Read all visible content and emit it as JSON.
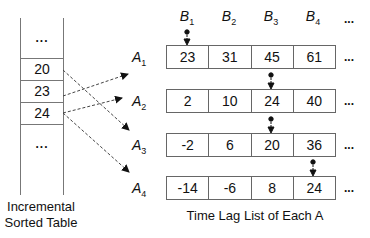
{
  "sorted_table": {
    "caption_line1": "Incremental",
    "caption_line2": "Sorted Table",
    "top_ellipsis": "...",
    "values": [
      "20",
      "23",
      "24"
    ],
    "bottom_ellipsis": "..."
  },
  "lag_lists": {
    "caption": "Time Lag List of Each A",
    "columns": [
      {
        "base": "B",
        "sub": "1"
      },
      {
        "base": "B",
        "sub": "2"
      },
      {
        "base": "B",
        "sub": "3"
      },
      {
        "base": "B",
        "sub": "4"
      }
    ],
    "column_ellipsis": "...",
    "rows": [
      {
        "base": "A",
        "sub": "1",
        "values": [
          "23",
          "31",
          "45",
          "61"
        ],
        "pointer_col": 0,
        "ellipsis": "..."
      },
      {
        "base": "A",
        "sub": "2",
        "values": [
          "2",
          "10",
          "24",
          "40"
        ],
        "pointer_col": 2,
        "ellipsis": "..."
      },
      {
        "base": "A",
        "sub": "3",
        "values": [
          "-2",
          "6",
          "20",
          "36"
        ],
        "pointer_col": 2,
        "ellipsis": "..."
      },
      {
        "base": "A",
        "sub": "4",
        "values": [
          "-14",
          "-6",
          "8",
          "24"
        ],
        "pointer_col": 3,
        "ellipsis": "..."
      }
    ]
  },
  "arrows": [
    {
      "from": "20",
      "to": "A3"
    },
    {
      "from": "23",
      "to": "A1"
    },
    {
      "from": "24",
      "to": "A2"
    },
    {
      "from": "24",
      "to": "A4"
    }
  ]
}
